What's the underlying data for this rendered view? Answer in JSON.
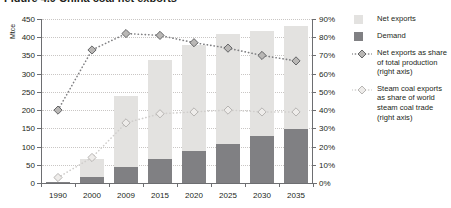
{
  "figure": {
    "title_sliver": "Figure 4.9  China coal net exports",
    "left_axis_title": "Mtce"
  },
  "legend": {
    "items": [
      {
        "label": "Net exports",
        "key": "swatch",
        "color": "#e3e2e0",
        "name": "net-exports"
      },
      {
        "label": "Demand",
        "key": "swatch",
        "color": "#808083",
        "name": "demand"
      },
      {
        "label": "Net exports as share of total production (right axis)",
        "key": "diamond",
        "color": "#808083",
        "name": "net-exports-share"
      },
      {
        "label": "Steam coal exports as share of world steam coal trade (right axis)",
        "key": "diamond",
        "color": "#d0cecc",
        "name": "steam-coal-share"
      }
    ]
  },
  "chart_data": {
    "type": "bar",
    "title": "China coal net exports",
    "xlabel": "",
    "ylabel": "Mtce",
    "y2label": "",
    "categories": [
      "1990",
      "2000",
      "2009",
      "2015",
      "2020",
      "2025",
      "2030",
      "2035"
    ],
    "ylim": [
      0,
      450
    ],
    "yticks": [
      0,
      50,
      100,
      150,
      200,
      250,
      300,
      350,
      400,
      450
    ],
    "ytick_labels": [
      "0",
      "50",
      "100",
      "150",
      "200",
      "250",
      "300",
      "350",
      "400",
      "450"
    ],
    "y2lim": [
      0,
      90
    ],
    "y2ticks": [
      0,
      10,
      20,
      30,
      40,
      50,
      60,
      70,
      80,
      90
    ],
    "y2tick_labels": [
      "0%",
      "10%",
      "20%",
      "30%",
      "40%",
      "50%",
      "60%",
      "70%",
      "80%",
      "90%"
    ],
    "grid": true,
    "stacked": true,
    "legend_position": "right",
    "series": [
      {
        "name": "Demand",
        "type": "bar",
        "axis": "left",
        "color": "#808083",
        "values": [
          3,
          17,
          43,
          67,
          88,
          108,
          129,
          149
        ]
      },
      {
        "name": "Net exports",
        "type": "bar",
        "axis": "left",
        "color": "#e3e2e0",
        "values": [
          1,
          48,
          196,
          271,
          290,
          300,
          288,
          283
        ]
      },
      {
        "name": "Total",
        "type": "bar-total",
        "axis": "left",
        "values": [
          4,
          65,
          239,
          338,
          378,
          408,
          417,
          432
        ]
      },
      {
        "name": "Net exports as share of total production (right axis)",
        "type": "line",
        "axis": "right",
        "color": "#808083",
        "marker": "diamond",
        "linestyle": "dotted",
        "values": [
          40,
          73,
          82,
          81,
          77,
          74,
          70,
          67
        ]
      },
      {
        "name": "Steam coal exports as share of world steam coal trade (right axis)",
        "type": "line",
        "axis": "right",
        "color": "#d0cecc",
        "marker": "diamond",
        "linestyle": "dotted",
        "values": [
          3,
          14,
          33,
          38,
          39,
          40,
          39,
          39
        ]
      }
    ]
  }
}
